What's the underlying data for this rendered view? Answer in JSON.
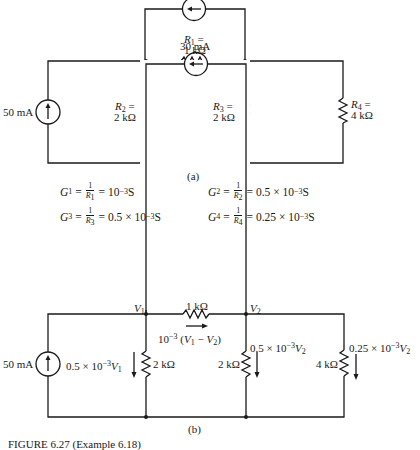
{
  "figure": {
    "caption": "FIGURE 6.27 (Example 6.18)",
    "part_a": {
      "label": "(a)",
      "source_left": {
        "value": "50 mA",
        "direction": "up"
      },
      "source_top": {
        "value": "",
        "direction": "left"
      },
      "resistors": [
        {
          "name": "R",
          "sub": "1",
          "eq": "=",
          "value": "1 kΩ"
        },
        {
          "name": "R",
          "sub": "2",
          "eq": "=",
          "value": "2 kΩ"
        },
        {
          "name": "R",
          "sub": "3",
          "eq": "=",
          "value": "2 kΩ"
        },
        {
          "name": "R",
          "sub": "4",
          "eq": "=",
          "value": "4 kΩ"
        }
      ]
    },
    "conductances": [
      {
        "g": "G",
        "sub": "1",
        "num": "1",
        "den_r": "R",
        "den_sub": "1",
        "result_pre": "= 10",
        "exp": "−3",
        "unit": " S"
      },
      {
        "g": "G",
        "sub": "2",
        "num": "1",
        "den_r": "R",
        "den_sub": "2",
        "result_pre": "= 0.5 × 10",
        "exp": "−3",
        "unit": " S"
      },
      {
        "g": "G",
        "sub": "3",
        "num": "1",
        "den_r": "R",
        "den_sub": "3",
        "result_pre": "= 0.5 × 10",
        "exp": "−3",
        "unit": " S"
      },
      {
        "g": "G",
        "sub": "4",
        "num": "1",
        "den_r": "R",
        "den_sub": "4",
        "result_pre": "= 0.25 × 10",
        "exp": "−3",
        "unit": " S"
      }
    ],
    "part_b": {
      "label": "(b)",
      "source_left": {
        "value": "50 mA",
        "direction": "up"
      },
      "source_top": {
        "value": "30 mA",
        "direction": "left"
      },
      "nodes": [
        {
          "name": "V",
          "sub": "1"
        },
        {
          "name": "V",
          "sub": "2"
        }
      ],
      "resistors": [
        {
          "value": "1 kΩ"
        },
        {
          "value": "2 kΩ"
        },
        {
          "value": "2 kΩ"
        },
        {
          "value": "4 kΩ"
        }
      ],
      "currents": [
        {
          "pre": "10",
          "exp": "−3",
          "post": " (",
          "v1": "V",
          "s1": "1",
          "mid": " − ",
          "v2": "V",
          "s2": "2",
          "end": ")"
        },
        {
          "pre": "0.5 × 10",
          "exp": "−3",
          "v": "V",
          "s": "1"
        },
        {
          "pre": "0.5 × 10",
          "exp": "−3",
          "v": "V",
          "s": "2"
        },
        {
          "pre": "0.25 × 10",
          "exp": "−3",
          "v": "V",
          "s": "2"
        }
      ]
    }
  }
}
